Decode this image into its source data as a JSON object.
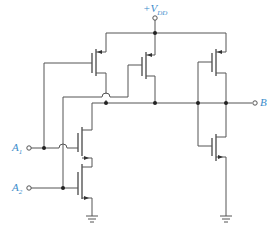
{
  "diagram": {
    "type": "CMOS logic circuit schematic",
    "labels": {
      "supply_prefix": "+V",
      "supply_sub": "DD",
      "input1_main": "A",
      "input1_sub": "1",
      "input2_main": "A",
      "input2_sub": "2",
      "output": "B"
    },
    "components": [
      {
        "name": "PMOS transistor (gate A1)",
        "type": "pmos"
      },
      {
        "name": "PMOS transistor (gate A2)",
        "type": "pmos"
      },
      {
        "name": "NMOS transistor (gate A1)",
        "type": "nmos"
      },
      {
        "name": "NMOS transistor (gate A2)",
        "type": "nmos"
      },
      {
        "name": "Inverter PMOS",
        "type": "pmos"
      },
      {
        "name": "Inverter NMOS",
        "type": "nmos"
      },
      {
        "name": "Ground (NAND stage)",
        "type": "ground"
      },
      {
        "name": "Ground (inverter)",
        "type": "ground"
      }
    ],
    "colors": {
      "wire": "#555555",
      "label": "#3b8ccb",
      "background": "#ffffff"
    }
  }
}
